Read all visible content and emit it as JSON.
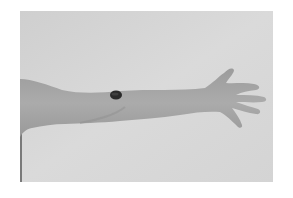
{
  "image": {
    "subject": "outstretched arm with dark oval skin patch",
    "alt": "Grayscale photo of an extended arm and open hand against a light gray background, with a dark oval mark on the upper forearm near the elbow",
    "colors": {
      "page_background": "#ffffff",
      "photo_background": "#d6d6d6",
      "skin": "#a9a9a9",
      "skin_shadow": "#8f8f8f",
      "patch": "#2a2a2a"
    }
  }
}
